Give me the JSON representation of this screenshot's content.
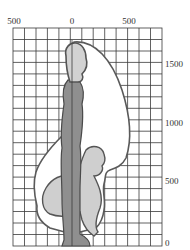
{
  "diagram": {
    "type": "posture reach envelope on grid",
    "x_axis": {
      "labels": [
        {
          "text": "500",
          "x": 14
        },
        {
          "text": "0",
          "x": 72
        },
        {
          "text": "500",
          "x": 129
        }
      ]
    },
    "y_axis": {
      "labels": [
        {
          "text": "1500",
          "y": 64
        },
        {
          "text": "1000",
          "y": 123
        },
        {
          "text": "500",
          "y": 181
        },
        {
          "text": "0",
          "y": 243
        }
      ]
    },
    "grid": {
      "left": 13,
      "right": 162,
      "top": 28,
      "bottom": 246,
      "columns": 13,
      "rows": 19,
      "color": "#3a3a3a"
    },
    "colors": {
      "envelope_fill": "#ffffff",
      "outline": "#555555",
      "standing_figure": "#8f8f8f",
      "squatting_figure": "#cfcfcf",
      "head": "#d2d2d2"
    },
    "figures": [
      "standing-person",
      "squatting-person",
      "reach-envelope"
    ]
  }
}
